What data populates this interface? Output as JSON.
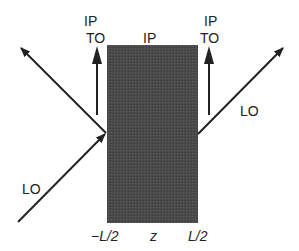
{
  "diagram": {
    "slab": {
      "fill": "#4a4a4a",
      "x_left_label": "−L/2",
      "x_mid_label": "z",
      "x_right_label": "L/2"
    },
    "labels": {
      "ip_top_left": "IP",
      "to_top_left": "TO",
      "ip_center": "IP",
      "ip_top_right": "IP",
      "to_top_right": "TO",
      "lo_left": "LO",
      "lo_right": "LO",
      "axis_left": "−L/2",
      "axis_mid": "z",
      "axis_right": "L/2"
    },
    "arrows": [
      {
        "name": "incident-lo",
        "from": [
          18,
          222
        ],
        "to": [
          106,
          133
        ]
      },
      {
        "name": "reflected-left",
        "from": [
          106,
          133
        ],
        "to": [
          20,
          47
        ]
      },
      {
        "name": "vertical-left",
        "from": [
          97,
          115
        ],
        "to": [
          97,
          48
        ]
      },
      {
        "name": "vertical-right",
        "from": [
          209,
          115
        ],
        "to": [
          209,
          48
        ]
      },
      {
        "name": "transmitted-lo",
        "from": [
          199,
          133
        ],
        "to": [
          283,
          48
        ]
      }
    ],
    "colors": {
      "line": "#222222",
      "slab": "#4a4a4a",
      "background": "#ffffff"
    }
  }
}
